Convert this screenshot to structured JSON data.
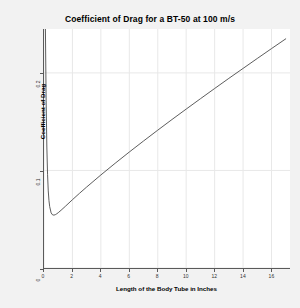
{
  "chart_data": {
    "type": "line",
    "title": "Coefficient of Drag for a BT-50 at 100 m/s",
    "xlabel": "Length of the Body Tube in Inches",
    "ylabel": "Coefficient of Drag",
    "xlim": [
      0,
      17.3
    ],
    "ylim": [
      0,
      0.245
    ],
    "xticks": [
      0,
      2,
      4,
      6,
      8,
      10,
      12,
      14,
      16
    ],
    "xticklabels": [
      "0",
      "2",
      "4",
      "6",
      "8",
      "10",
      "12",
      "14",
      "16"
    ],
    "yticks": [
      0,
      0.1,
      0.2
    ],
    "yticklabels": [
      "0",
      "0.1",
      "0.2"
    ],
    "grid": true,
    "legend": "none",
    "series": [
      {
        "name": "Coefficient of Drag",
        "color": "#4a4a4a",
        "x": [
          0.1,
          0.15,
          0.2,
          0.25,
          0.3,
          0.35,
          0.4,
          0.5,
          0.6,
          0.7,
          0.8,
          0.9,
          1.0,
          1.2,
          1.5,
          2.0,
          2.5,
          3.0,
          4.0,
          5.0,
          6.0,
          7.0,
          8.0,
          9.0,
          10.0,
          11.0,
          12.0,
          13.0,
          14.0,
          15.0,
          16.0,
          17.0
        ],
        "y": [
          0.245,
          0.172,
          0.124,
          0.096,
          0.079,
          0.069,
          0.063,
          0.0565,
          0.0545,
          0.0542,
          0.0547,
          0.0556,
          0.0567,
          0.0592,
          0.0632,
          0.07,
          0.0766,
          0.083,
          0.0954,
          0.1073,
          0.1189,
          0.1302,
          0.1413,
          0.1522,
          0.1629,
          0.1735,
          0.184,
          0.1944,
          0.2046,
          0.2148,
          0.2249,
          0.2349
        ]
      }
    ]
  },
  "figure": {
    "background_color": "#f2f2f2",
    "plot_background_color": "#ffffff",
    "grid_color": "#e8e8e8",
    "axis_color": "#5a5a5a"
  }
}
